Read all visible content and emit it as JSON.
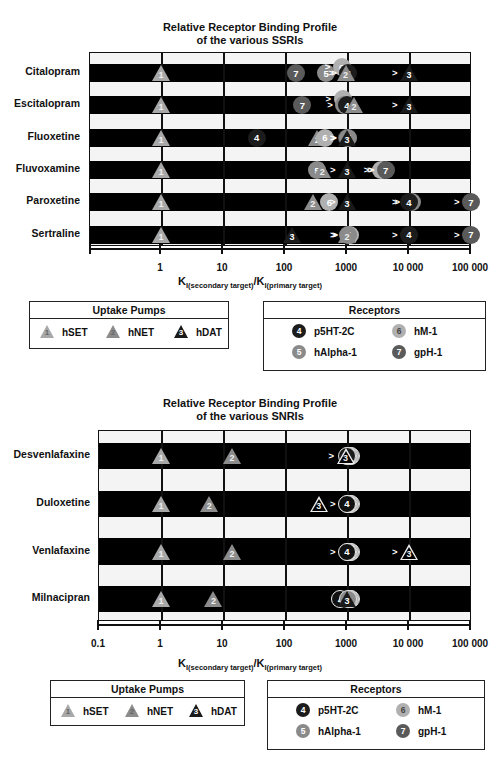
{
  "colors": {
    "hSET": "#a8a8a8",
    "hNET": "#8c8c8c",
    "hDAT": "#1a1a1a",
    "p5HT2C": "#1c1c1c",
    "hAlpha1": "#8a8a8a",
    "hM1": "#b0b0b0",
    "gpH1": "#5a5a5a"
  },
  "chart_data": [
    {
      "type": "scatter",
      "title": "Relative Receptor Binding Profile of the various SSRIs",
      "title_lines": [
        "Relative Receptor Binding Profile",
        "of the various SSRIs"
      ],
      "xlabel_main": "K",
      "xlabel_sub1": "I(secondary target)",
      "xlabel_sep": "/K",
      "xlabel_sub2": "I(primary target)",
      "xscale": "log",
      "xlim": [
        0.03,
        100000
      ],
      "ticks": [
        1,
        10,
        100,
        1000,
        10000,
        100000
      ],
      "tick_labels": [
        "1",
        "10",
        "100",
        "1000",
        "10 000",
        "100 000"
      ],
      "grid": true,
      "categories": [
        "Citalopram",
        "Escitalopram",
        "Fluoxetine",
        "Fluvoxamine",
        "Paroxetine",
        "Sertraline"
      ],
      "series": [
        {
          "drug": "Citalopram",
          "markers": [
            {
              "id": "1",
              "target": "hSET",
              "shape": "triangle",
              "x": 1
            },
            {
              "id": "7",
              "target": "gpH-1",
              "shape": "circle",
              "x": 150
            },
            {
              "id": "5",
              "target": "hAlpha-1",
              "shape": "circle",
              "x": 460
            },
            {
              "id": "6",
              "target": "hM-1",
              "shape": "circle",
              "x": 820,
              "gt": true,
              "dy": -6
            },
            {
              "id": "4",
              "target": "p5HT-2C",
              "shape": "circle",
              "x": 1050,
              "gt": true
            },
            {
              "id": "2",
              "target": "hNET",
              "shape": "triangle",
              "x": 950,
              "gt": true
            },
            {
              "id": "3",
              "target": "hDAT",
              "shape": "triangle",
              "x": 10000,
              "gt": true
            }
          ]
        },
        {
          "drug": "Escitalopram",
          "markers": [
            {
              "id": "1",
              "target": "hSET",
              "shape": "triangle",
              "x": 1
            },
            {
              "id": "7",
              "target": "gpH-1",
              "shape": "circle",
              "x": 190
            },
            {
              "id": "6",
              "target": "hM-1",
              "shape": "circle",
              "x": 850,
              "gt": true,
              "dy": -6
            },
            {
              "id": "5",
              "target": "hAlpha-1",
              "shape": "circle",
              "x": 900,
              "gt": true
            },
            {
              "id": "4",
              "target": "p5HT-2C",
              "shape": "circle",
              "x": 1000
            },
            {
              "id": "2",
              "target": "hNET",
              "shape": "triangle",
              "x": 1300
            },
            {
              "id": "3",
              "target": "hDAT",
              "shape": "triangle",
              "x": 10000,
              "gt": true
            }
          ]
        },
        {
          "drug": "Fluoxetine",
          "markers": [
            {
              "id": "1",
              "target": "hSET",
              "shape": "triangle",
              "x": 1
            },
            {
              "id": "4",
              "target": "p5HT-2C",
              "shape": "circle",
              "x": 35
            },
            {
              "id": "2",
              "target": "hNET",
              "shape": "triangle",
              "x": 330
            },
            {
              "id": "6",
              "target": "hM-1",
              "shape": "circle",
              "x": 440
            },
            {
              "id": "7",
              "target": "gpH-1",
              "shape": "circle",
              "x": 1000,
              "gt": true
            },
            {
              "id": "5",
              "target": "hAlpha-1",
              "shape": "circle",
              "x": 1050,
              "gt": true
            },
            {
              "id": "3",
              "target": "hDAT",
              "shape": "triangle",
              "x": 1000,
              "gt": true
            }
          ]
        },
        {
          "drug": "Fluvoxamine",
          "markers": [
            {
              "id": "1",
              "target": "hSET",
              "shape": "triangle",
              "x": 1
            },
            {
              "id": "5",
              "target": "hAlpha-1",
              "shape": "circle",
              "x": 330
            },
            {
              "id": "2",
              "target": "hNET",
              "shape": "triangle",
              "x": 400
            },
            {
              "id": "3",
              "target": "hDAT",
              "shape": "triangle",
              "x": 1000,
              "gt": true
            },
            {
              "id": "4",
              "target": "p5HT-2C",
              "shape": "circle",
              "x": 4000,
              "gt": true
            },
            {
              "id": "6",
              "target": "hM-1",
              "shape": "circle",
              "x": 3500,
              "gt": true
            },
            {
              "id": "7",
              "target": "gpH-1",
              "shape": "circle",
              "x": 4200,
              "gt": true
            }
          ]
        },
        {
          "drug": "Paroxetine",
          "markers": [
            {
              "id": "1",
              "target": "hSET",
              "shape": "triangle",
              "x": 1
            },
            {
              "id": "2",
              "target": "hNET",
              "shape": "triangle",
              "x": 280
            },
            {
              "id": "6",
              "target": "hM-1",
              "shape": "circle",
              "x": 520
            },
            {
              "id": "3",
              "target": "hDAT",
              "shape": "triangle",
              "x": 1000,
              "gt": true
            },
            {
              "id": "5",
              "target": "hAlpha-1",
              "shape": "circle",
              "x": 11000,
              "gt": true
            },
            {
              "id": "4",
              "target": "p5HT-2C",
              "shape": "circle",
              "x": 10000,
              "gt": true
            },
            {
              "id": "7",
              "target": "gpH-1",
              "shape": "circle",
              "x": 100000,
              "gt": true
            }
          ]
        },
        {
          "drug": "Sertraline",
          "markers": [
            {
              "id": "3",
              "target": "hDAT",
              "shape": "triangle",
              "x": 130
            },
            {
              "id": "1",
              "target": "hSET",
              "shape": "triangle",
              "x": 1
            },
            {
              "id": "6",
              "target": "hM-1",
              "shape": "circle",
              "x": 1100,
              "gt": true
            },
            {
              "id": "5",
              "target": "hAlpha-1",
              "shape": "circle",
              "x": 1050,
              "gt": true
            },
            {
              "id": "2",
              "target": "hNET",
              "shape": "triangle",
              "x": 1000,
              "gt": true
            },
            {
              "id": "4",
              "target": "p5HT-2C",
              "shape": "circle",
              "x": 10000,
              "gt": true
            },
            {
              "id": "7",
              "target": "gpH-1",
              "shape": "circle",
              "x": 100000,
              "gt": true
            }
          ]
        }
      ],
      "legend": {
        "uptake_title": "Uptake Pumps",
        "uptake": [
          {
            "id": "1",
            "label": "hSET"
          },
          {
            "id": "2",
            "label": "hNET"
          },
          {
            "id": "3",
            "label": "hDAT"
          }
        ],
        "receptor_title": "Receptors",
        "receptors": [
          {
            "id": "4",
            "label": "p5HT-2C"
          },
          {
            "id": "6",
            "label": "hM-1"
          },
          {
            "id": "5",
            "label": "hAlpha-1"
          },
          {
            "id": "7",
            "label": "gpH-1"
          }
        ]
      }
    },
    {
      "type": "scatter",
      "title": "Relative Receptor Binding Profile of the various SNRIs",
      "title_lines": [
        "Relative Receptor Binding Profile",
        "of the various SNRIs"
      ],
      "xlabel_main": "K",
      "xlabel_sub1": "I(secondary target)",
      "xlabel_sep": "/K",
      "xlabel_sub2": "I(primary target)",
      "xscale": "log",
      "xlim": [
        0.1,
        100000
      ],
      "ticks": [
        0.1,
        1,
        10,
        100,
        1000,
        10000,
        100000
      ],
      "tick_labels": [
        "0.1",
        "1",
        "10",
        "100",
        "1000",
        "10 000",
        "100 000"
      ],
      "grid": true,
      "categories": [
        "Desvenlafaxine",
        "Duloxetine",
        "Venlafaxine",
        "Milnacipran"
      ],
      "series": [
        {
          "drug": "Desvenlafaxine",
          "markers": [
            {
              "id": "1",
              "target": "hSET",
              "shape": "triangle",
              "x": 1
            },
            {
              "id": "2",
              "target": "hNET",
              "shape": "triangle",
              "x": 14
            },
            {
              "id": "7",
              "target": "gpH-1",
              "shape": "circle",
              "x": 1150,
              "stack": true
            },
            {
              "id": "6",
              "target": "hM-1",
              "shape": "circle",
              "x": 1100,
              "stack": true
            },
            {
              "id": "5",
              "target": "hAlpha-1",
              "shape": "circle",
              "x": 1050,
              "stack": true
            },
            {
              "id": "4",
              "target": "p5HT-2C",
              "shape": "circle",
              "x": 1000,
              "stack": true
            },
            {
              "id": "3",
              "target": "hDAT",
              "shape": "triangle-outline",
              "x": 950,
              "gt": true
            }
          ]
        },
        {
          "drug": "Duloxetine",
          "markers": [
            {
              "id": "1",
              "target": "hSET",
              "shape": "triangle",
              "x": 1
            },
            {
              "id": "2",
              "target": "hNET",
              "shape": "triangle",
              "x": 6
            },
            {
              "id": "3",
              "target": "hDAT",
              "shape": "triangle-outline",
              "x": 350
            },
            {
              "id": "7",
              "target": "gpH-1",
              "shape": "circle",
              "x": 1150,
              "stack": true
            },
            {
              "id": "6",
              "target": "hM-1",
              "shape": "circle",
              "x": 1100,
              "stack": true
            },
            {
              "id": "5",
              "target": "hAlpha-1",
              "shape": "circle",
              "x": 1050,
              "stack": true
            },
            {
              "id": "4",
              "target": "p5HT-2C",
              "shape": "circle-outline",
              "x": 1000,
              "gt": true
            }
          ]
        },
        {
          "drug": "Venlafaxine",
          "markers": [
            {
              "id": "1",
              "target": "hSET",
              "shape": "triangle",
              "x": 1
            },
            {
              "id": "2",
              "target": "hNET",
              "shape": "triangle",
              "x": 14
            },
            {
              "id": "7",
              "target": "gpH-1",
              "shape": "circle",
              "x": 1150,
              "stack": true
            },
            {
              "id": "6",
              "target": "hM-1",
              "shape": "circle",
              "x": 1100,
              "stack": true
            },
            {
              "id": "5",
              "target": "hAlpha-1",
              "shape": "circle",
              "x": 1050,
              "stack": true
            },
            {
              "id": "4",
              "target": "p5HT-2C",
              "shape": "circle-outline",
              "x": 1000,
              "gt": true
            },
            {
              "id": "3",
              "target": "hDAT",
              "shape": "triangle-outline",
              "x": 10000,
              "gt": true
            }
          ]
        },
        {
          "drug": "Milnacipran",
          "markers": [
            {
              "id": "1",
              "target": "hSET",
              "shape": "triangle",
              "x": 1
            },
            {
              "id": "2",
              "target": "hNET",
              "shape": "triangle",
              "x": 7
            },
            {
              "id": "4",
              "target": "p5HT-2C",
              "shape": "circle-outline",
              "x": 780
            },
            {
              "id": "7",
              "target": "gpH-1",
              "shape": "circle",
              "x": 1150,
              "stack": true
            },
            {
              "id": "6",
              "target": "hM-1",
              "shape": "circle",
              "x": 1100,
              "stack": true
            },
            {
              "id": "5",
              "target": "hAlpha-1",
              "shape": "circle",
              "x": 1050,
              "stack": true
            },
            {
              "id": "3",
              "target": "hDAT",
              "shape": "triangle",
              "x": 1000
            }
          ]
        }
      ],
      "legend": {
        "uptake_title": "Uptake Pumps",
        "uptake": [
          {
            "id": "1",
            "label": "hSET"
          },
          {
            "id": "2",
            "label": "hNET"
          },
          {
            "id": "3",
            "label": "hDAT"
          }
        ],
        "receptor_title": "Receptors",
        "receptors": [
          {
            "id": "4",
            "label": "p5HT-2C"
          },
          {
            "id": "6",
            "label": "hM-1"
          },
          {
            "id": "5",
            "label": "hAlpha-1"
          },
          {
            "id": "7",
            "label": "gpH-1"
          }
        ]
      }
    }
  ]
}
